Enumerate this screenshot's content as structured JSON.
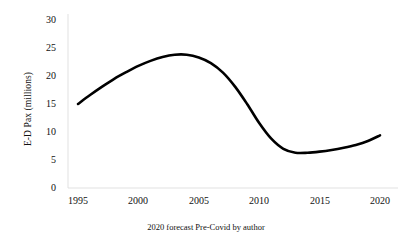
{
  "chart_data": {
    "type": "line",
    "title": "",
    "subtitle": "",
    "caption": "2020 forecast Pre-Covid by author",
    "xlabel": "",
    "ylabel": "E-D Pax (millions)",
    "xlim": [
      1993.5,
      2021.5
    ],
    "ylim": [
      0,
      30
    ],
    "grid": false,
    "legend": false,
    "legend_position": "none",
    "xticks": [
      "1995",
      "2000",
      "2005",
      "2010",
      "2015",
      "2020"
    ],
    "xtick_values": [
      1995,
      2000,
      2005,
      2010,
      2015,
      2020
    ],
    "yticks": [
      "0",
      "5",
      "10",
      "15",
      "20",
      "25",
      "30"
    ],
    "ytick_values": [
      0,
      5,
      10,
      15,
      20,
      25,
      30
    ],
    "series": [
      {
        "name": "E-D Pax",
        "color": "#000000",
        "x": [
          1995,
          1996,
          1997,
          1998,
          1999,
          2000,
          2001,
          2002,
          2003,
          2004,
          2005,
          2006,
          2007,
          2008,
          2009,
          2010,
          2011,
          2012,
          2013,
          2014,
          2015,
          2016,
          2017,
          2018,
          2019,
          2020
        ],
        "values": [
          15.0,
          16.6,
          18.1,
          19.5,
          20.7,
          21.8,
          22.7,
          23.4,
          23.8,
          23.8,
          23.3,
          22.3,
          20.6,
          18.1,
          15.0,
          11.6,
          8.8,
          7.0,
          6.3,
          6.3,
          6.5,
          6.8,
          7.2,
          7.7,
          8.4,
          9.4
        ]
      }
    ]
  },
  "colors": {
    "series": "#000000",
    "axis": "#d9d9d9",
    "text": "#111111",
    "background": "#ffffff"
  }
}
